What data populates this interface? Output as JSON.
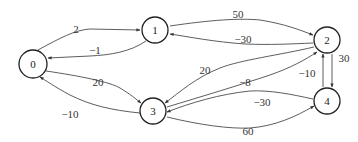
{
  "diagram": {
    "type": "directed-weighted-graph",
    "nodes": [
      {
        "id": "0",
        "label": "0",
        "x": 33,
        "y": 64
      },
      {
        "id": "1",
        "label": "1",
        "x": 155,
        "y": 30
      },
      {
        "id": "2",
        "label": "2",
        "x": 327,
        "y": 40
      },
      {
        "id": "3",
        "label": "3",
        "x": 153,
        "y": 111
      },
      {
        "id": "4",
        "label": "4",
        "x": 327,
        "y": 101
      }
    ],
    "edges": [
      {
        "from": "0",
        "to": "1",
        "weight": "2"
      },
      {
        "from": "1",
        "to": "0",
        "weight": "-1"
      },
      {
        "from": "0",
        "to": "3",
        "weight": "20"
      },
      {
        "from": "3",
        "to": "0",
        "weight": "-10"
      },
      {
        "from": "1",
        "to": "2",
        "weight": "50"
      },
      {
        "from": "2",
        "to": "1",
        "weight": "-30"
      },
      {
        "from": "2",
        "to": "3",
        "weight": "20"
      },
      {
        "from": "3",
        "to": "2",
        "weight": "-8"
      },
      {
        "from": "2",
        "to": "4",
        "weight": "30"
      },
      {
        "from": "4",
        "to": "2",
        "weight": "-10"
      },
      {
        "from": "4",
        "to": "3",
        "weight": "-30"
      },
      {
        "from": "3",
        "to": "4",
        "weight": "60"
      }
    ]
  },
  "labels": {
    "n0": "0",
    "n1": "1",
    "n2": "2",
    "n3": "3",
    "n4": "4",
    "e01": "2",
    "e10": "−1",
    "e03": "20",
    "e30": "−10",
    "e12": "50",
    "e21": "−30",
    "e23": "20",
    "e32": "−8",
    "e24": "30",
    "e42": "−10",
    "e43": "−30",
    "e34": "60"
  }
}
